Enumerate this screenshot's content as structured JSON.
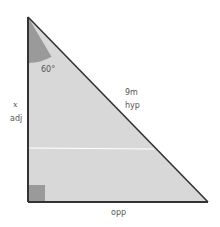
{
  "diagram": {
    "type": "right-triangle",
    "colors": {
      "fill": "#d8d8d8",
      "stroke": "#333333",
      "angle_arc": "#9a9a9a",
      "right_angle": "#9a9a9a",
      "divider_line": "#ffffff",
      "label": "#555555"
    },
    "angle_label": "60°",
    "hypotenuse": {
      "length_label": "9m",
      "side_label": "hyp"
    },
    "adjacent": {
      "variable_label": "x",
      "side_label": "adj"
    },
    "opposite": {
      "side_label": "opp"
    }
  }
}
